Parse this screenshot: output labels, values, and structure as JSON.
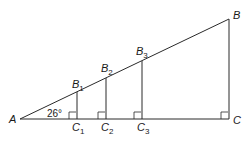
{
  "diagram": {
    "type": "similar-right-triangles",
    "angle_label": "26°",
    "vertex_A": "A",
    "vertex_B": "B",
    "vertex_C": "C",
    "points": [
      {
        "B": "B",
        "Bsub": "1",
        "C": "C",
        "Csub": "1"
      },
      {
        "B": "B",
        "Bsub": "2",
        "C": "C",
        "Csub": "2"
      },
      {
        "B": "B",
        "Bsub": "3",
        "C": "C",
        "Csub": "3"
      }
    ]
  }
}
